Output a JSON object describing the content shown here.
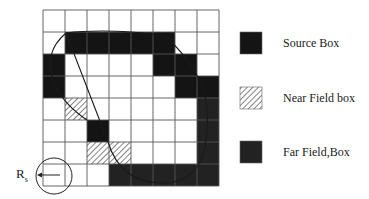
{
  "diagram": {
    "grid": {
      "rows": 8,
      "cols": 8,
      "origin": [
        43,
        10
      ],
      "cell_size": 22,
      "line_color": "#555555",
      "cells": [
        [
          "w",
          "w",
          "w",
          "w",
          "w",
          "w",
          "w",
          "w"
        ],
        [
          "w",
          "s",
          "s",
          "s",
          "s",
          "s",
          "w",
          "w"
        ],
        [
          "s",
          "w",
          "w",
          "w",
          "w",
          "s",
          "s",
          "w"
        ],
        [
          "s",
          "w",
          "w",
          "w",
          "w",
          "w",
          "s",
          "s"
        ],
        [
          "w",
          "n",
          "w",
          "w",
          "w",
          "w",
          "w",
          "f"
        ],
        [
          "w",
          "w",
          "s",
          "w",
          "w",
          "w",
          "w",
          "f"
        ],
        [
          "w",
          "w",
          "n",
          "n",
          "w",
          "w",
          "w",
          "f"
        ],
        [
          "w",
          "w",
          "w",
          "f",
          "f",
          "f",
          "f",
          "f"
        ]
      ],
      "cell_legend": {
        "w": "empty",
        "s": "Source Box",
        "n": "Near Field box",
        "f": "Far Field Box"
      }
    },
    "colors": {
      "source": "#141414",
      "far_field": "#222222",
      "near_field_hatch": "#333333",
      "curve": "#1a1a1a",
      "grid_line": "#555555"
    },
    "legend": [
      {
        "key": "source",
        "label": "Source Box"
      },
      {
        "key": "near",
        "label": "Near Field box"
      },
      {
        "key": "far",
        "label": "Far Field,Box"
      }
    ],
    "radius_marker": {
      "label_main": "R",
      "label_sub": "s"
    }
  }
}
